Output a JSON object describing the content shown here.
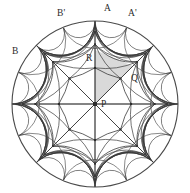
{
  "figure": {
    "kind": "geometric-diagram"
  },
  "colors": {
    "stroke": "#3a3a3a",
    "boundary": "#4a4a4a",
    "shaded_region": "#d9d9d9",
    "label": "#2b2b2b",
    "background": "#ffffff",
    "vertex": "#2b2b2b"
  },
  "geometry": {
    "disk": {
      "cx": 95,
      "cy": 104,
      "r": 83
    },
    "symmetry_order": 8,
    "ring_radii": [
      0.0,
      0.435,
      0.72,
      0.875,
      0.95,
      1.0
    ]
  },
  "labels": [
    {
      "text": "A",
      "x": 104,
      "y": 4,
      "name": "label-a"
    },
    {
      "text": "A'",
      "x": 128,
      "y": 9,
      "name": "label-a-prime"
    },
    {
      "text": "B'",
      "x": 57,
      "y": 9,
      "name": "label-b-prime"
    },
    {
      "text": "B",
      "x": 12,
      "y": 47,
      "name": "label-b"
    },
    {
      "text": "R",
      "x": 86,
      "y": 54,
      "name": "label-r"
    },
    {
      "text": "Q",
      "x": 131,
      "y": 74,
      "name": "label-q"
    },
    {
      "text": "P",
      "x": 101,
      "y": 100,
      "name": "label-p"
    }
  ],
  "points": {
    "P": {
      "x": 95,
      "y": 104,
      "desc": "disk center"
    },
    "Q": {
      "x": 133,
      "y": 66,
      "desc": "inner ring vertex"
    },
    "R": {
      "x": 95,
      "y": 50,
      "desc": "inner ring vertex on vertical axis"
    }
  },
  "shaded_triangle": {
    "vertices": [
      "P",
      "R",
      "Q"
    ],
    "fill": "#d9d9d9"
  }
}
